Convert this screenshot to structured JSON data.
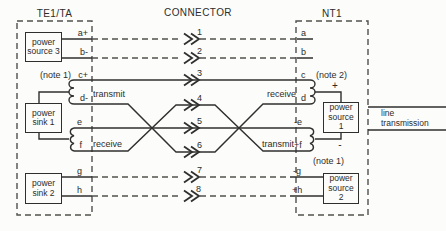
{
  "figure": {
    "te": {
      "title": "TE1/TA",
      "units": {
        "power_source_3": "power source 3",
        "power_sink_1": "power sink 1",
        "power_sink_2": "power sink 2"
      },
      "transmit_label": "transmit",
      "receive_label": "receive",
      "note": "(note 1)"
    },
    "connector": {
      "title": "CONNECTOR"
    },
    "nt": {
      "title": "NT1",
      "units": {
        "power_source_1": "power source 1",
        "power_source_2": "power source 2"
      },
      "receive_label": "receive",
      "transmit_label": "transmit",
      "note_top": "(note 2)",
      "note_bottom": "(note 1)",
      "plus": "+",
      "minus": "-"
    },
    "line_transmission": "line transmission",
    "wires": [
      {
        "no": "1",
        "left": "a+",
        "right": "a"
      },
      {
        "no": "2",
        "left": "b-",
        "right": "b"
      },
      {
        "no": "3",
        "left": "c+",
        "right": "c"
      },
      {
        "no": "4",
        "left": "d-",
        "right": "d"
      },
      {
        "no": "5",
        "left": "e",
        "right": "-e"
      },
      {
        "no": "6",
        "left": "f",
        "right": "+f"
      },
      {
        "no": "7",
        "left": "g",
        "right": "-g"
      },
      {
        "no": "8",
        "left": "h",
        "right": "+h"
      }
    ],
    "colors": {
      "line": "#2f2f2e",
      "dashed": "#50504e",
      "text": "#2c2c2b",
      "bg": "#fcfcfa"
    }
  }
}
